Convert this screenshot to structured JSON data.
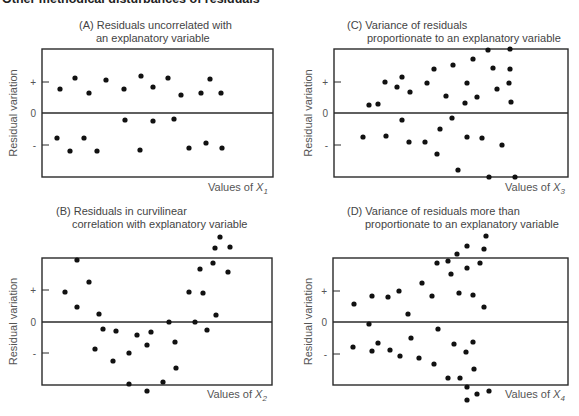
{
  "figure_title": "Other methodical disturbances of residuals",
  "colors": {
    "frame": "#2a2a2a",
    "point": "#111111",
    "text": "#555555"
  },
  "chart_data": [
    {
      "id": "A",
      "type": "scatter",
      "title_lines": [
        "(A) Residuals uncorrelated with",
        "an explanatory variable"
      ],
      "xlabel": "Values of X",
      "xlabel_sub": "1",
      "ylabel": "Residual variation",
      "y_ticks": [
        "+",
        "0",
        "-"
      ],
      "grid": false,
      "frame": {
        "x": 42,
        "y": 49,
        "w": 231,
        "h": 128,
        "zero_y": 113,
        "plus_y": 82,
        "minus_y": 145
      },
      "title_pos": {
        "x1": 79,
        "y1": 29,
        "x2": 96,
        "y2": 42
      },
      "ylabel_x": 17,
      "xlabel_pos": {
        "x": 208,
        "y": 191
      },
      "points": [
        [
          60,
          89
        ],
        [
          75,
          78
        ],
        [
          89,
          93
        ],
        [
          106,
          80
        ],
        [
          124,
          89
        ],
        [
          141,
          76
        ],
        [
          153,
          87
        ],
        [
          168,
          78
        ],
        [
          181,
          95
        ],
        [
          201,
          93
        ],
        [
          210,
          79
        ],
        [
          221,
          93
        ],
        [
          125,
          120
        ],
        [
          153,
          121
        ],
        [
          174,
          119
        ],
        [
          57,
          138
        ],
        [
          70,
          151
        ],
        [
          84,
          138
        ],
        [
          97,
          151
        ],
        [
          140,
          150
        ],
        [
          189,
          148
        ],
        [
          206,
          143
        ],
        [
          222,
          148
        ]
      ]
    },
    {
      "id": "B",
      "type": "scatter",
      "title_lines": [
        "(B) Residuals in curvilinear",
        "correlation with explanatory variable"
      ],
      "xlabel": "Values of X",
      "xlabel_sub": "2",
      "ylabel": "Residual variation",
      "y_ticks": [
        "+",
        "0",
        "-"
      ],
      "grid": false,
      "frame": {
        "x": 42,
        "y": 258,
        "w": 230,
        "h": 127,
        "zero_y": 322,
        "plus_y": 290,
        "minus_y": 353
      },
      "title_pos": {
        "x1": 56,
        "y1": 215,
        "x2": 72,
        "y2": 228
      },
      "ylabel_x": 17,
      "xlabel_pos": {
        "x": 207,
        "y": 398
      },
      "points": [
        [
          65,
          292
        ],
        [
          77,
          260
        ],
        [
          77,
          307
        ],
        [
          89,
          282
        ],
        [
          99,
          314
        ],
        [
          103,
          329
        ],
        [
          116,
          331
        ],
        [
          95,
          349
        ],
        [
          113,
          361
        ],
        [
          129,
          353
        ],
        [
          137,
          335
        ],
        [
          147,
          345
        ],
        [
          151,
          332
        ],
        [
          129,
          384
        ],
        [
          147,
          391
        ],
        [
          163,
          382
        ],
        [
          169,
          322
        ],
        [
          175,
          342
        ],
        [
          176,
          368
        ],
        [
          189,
          292
        ],
        [
          195,
          322
        ],
        [
          200,
          269
        ],
        [
          203,
          293
        ],
        [
          207,
          330
        ],
        [
          213,
          263
        ],
        [
          216,
          315
        ],
        [
          215,
          248
        ],
        [
          220,
          237
        ],
        [
          228,
          272
        ],
        [
          230,
          247
        ]
      ]
    },
    {
      "id": "C",
      "type": "scatter",
      "title_lines": [
        "(C) Variance of residuals",
        "proportionate to an explanatory variable"
      ],
      "xlabel": "Values of X",
      "xlabel_sub": "3",
      "ylabel": "Residual variation",
      "y_ticks": [
        "+",
        "0",
        "-"
      ],
      "grid": false,
      "frame": {
        "x": 334,
        "y": 49,
        "w": 234,
        "h": 128,
        "zero_y": 113,
        "plus_y": 82,
        "minus_y": 145
      },
      "title_pos": {
        "x1": 347,
        "y1": 29,
        "x2": 367,
        "y2": 42
      },
      "ylabel_x": 312,
      "xlabel_pos": {
        "x": 505,
        "y": 191
      },
      "points": [
        [
          369,
          105
        ],
        [
          378,
          104
        ],
        [
          385,
          82
        ],
        [
          397,
          87
        ],
        [
          402,
          77
        ],
        [
          410,
          92
        ],
        [
          427,
          83
        ],
        [
          434,
          69
        ],
        [
          446,
          96
        ],
        [
          453,
          65
        ],
        [
          467,
          83
        ],
        [
          465,
          103
        ],
        [
          473,
          59
        ],
        [
          477,
          97
        ],
        [
          488,
          50
        ],
        [
          493,
          68
        ],
        [
          497,
          89
        ],
        [
          510,
          49
        ],
        [
          510,
          69
        ],
        [
          509,
          83
        ],
        [
          511,
          102
        ],
        [
          402,
          120
        ],
        [
          452,
          118
        ],
        [
          440,
          129
        ],
        [
          363,
          137
        ],
        [
          386,
          136
        ],
        [
          409,
          142
        ],
        [
          425,
          142
        ],
        [
          437,
          154
        ],
        [
          467,
          137
        ],
        [
          482,
          138
        ],
        [
          502,
          145
        ],
        [
          458,
          170
        ],
        [
          489,
          177
        ],
        [
          515,
          177
        ]
      ]
    },
    {
      "id": "D",
      "type": "scatter",
      "title_lines": [
        "(D) Variance of residuals more than",
        "proportionate to an explanatory variable"
      ],
      "xlabel": "Values of X",
      "xlabel_sub": "4",
      "ylabel": "Residual variation",
      "y_ticks": [
        "+",
        "0",
        "-"
      ],
      "grid": false,
      "frame": {
        "x": 333,
        "y": 258,
        "w": 235,
        "h": 127,
        "zero_y": 322,
        "plus_y": 291,
        "minus_y": 354
      },
      "title_pos": {
        "x1": 347,
        "y1": 215,
        "x2": 365,
        "y2": 228
      },
      "ylabel_x": 312,
      "xlabel_pos": {
        "x": 505,
        "y": 398
      },
      "points": [
        [
          354,
          304
        ],
        [
          372,
          296
        ],
        [
          388,
          297
        ],
        [
          399,
          291
        ],
        [
          408,
          314
        ],
        [
          422,
          283
        ],
        [
          432,
          296
        ],
        [
          437,
          263
        ],
        [
          448,
          261
        ],
        [
          451,
          274
        ],
        [
          457,
          254
        ],
        [
          459,
          293
        ],
        [
          467,
          246
        ],
        [
          467,
          268
        ],
        [
          473,
          295
        ],
        [
          480,
          263
        ],
        [
          484,
          307
        ],
        [
          484,
          249
        ],
        [
          486,
          236
        ],
        [
          369,
          324
        ],
        [
          353,
          347
        ],
        [
          372,
          351
        ],
        [
          378,
          343
        ],
        [
          390,
          350
        ],
        [
          400,
          356
        ],
        [
          411,
          338
        ],
        [
          419,
          358
        ],
        [
          434,
          364
        ],
        [
          438,
          329
        ],
        [
          454,
          344
        ],
        [
          448,
          378
        ],
        [
          460,
          378
        ],
        [
          466,
          352
        ],
        [
          473,
          342
        ],
        [
          474,
          369
        ],
        [
          467,
          387
        ],
        [
          477,
          394
        ],
        [
          489,
          391
        ],
        [
          467,
          400
        ]
      ]
    }
  ]
}
